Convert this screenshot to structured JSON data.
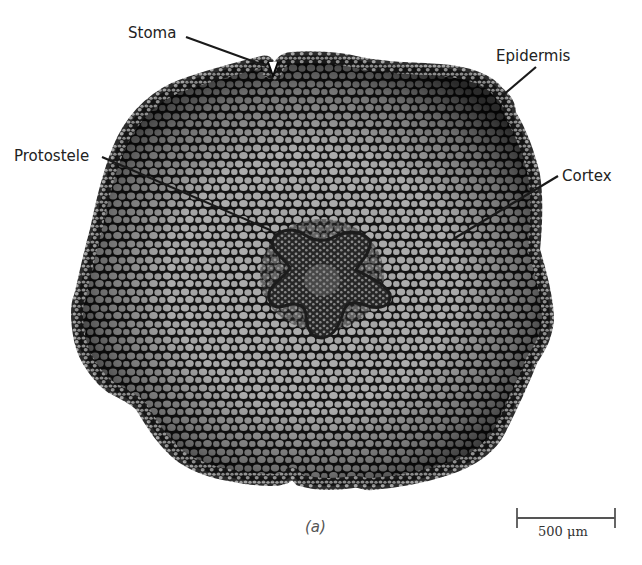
{
  "figure": {
    "caption": "(a)",
    "labels": {
      "stoma": "Stoma",
      "epidermis": "Epidermis",
      "protostele": "Protostele",
      "cortex": "Cortex"
    },
    "scale_bar": {
      "text": "500 μm",
      "length_px": 152
    },
    "colors": {
      "cell_wall": "#141414",
      "cell_lumen": "#a9a9a9",
      "stele_dark": "#2a2a2a",
      "background": "#ffffff",
      "label_text": "#222222"
    }
  }
}
